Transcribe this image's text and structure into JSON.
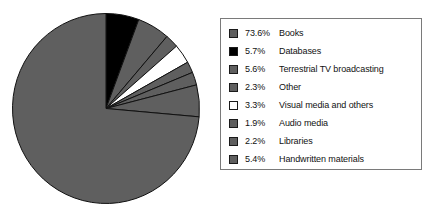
{
  "chart_data": {
    "type": "pie",
    "title": "",
    "subtitle": "",
    "xlabel": "",
    "ylabel": "",
    "legend_position": "right",
    "grid": false,
    "start_angle_deg": 0,
    "direction": "clockwise",
    "units": "percent",
    "categories": [
      "Books",
      "Databases",
      "Terrestrial TV broadcasting",
      "Other",
      "Visual media and others",
      "Audio media",
      "Libraries",
      "Handwritten materials"
    ],
    "values": [
      73.6,
      5.7,
      5.6,
      2.3,
      3.3,
      1.9,
      2.2,
      5.4
    ],
    "value_labels": [
      "73.6%",
      "5.7%",
      "5.6%",
      "2.3%",
      "3.3%",
      "1.9%",
      "2.2%",
      "5.4%"
    ],
    "colors": [
      "#5f5f5f",
      "#000000",
      "#5f5f5f",
      "#5f5f5f",
      "#ffffff",
      "#5f5f5f",
      "#5f5f5f",
      "#5f5f5f"
    ],
    "slice_order_clockwise_from_top": [
      "Databases",
      "Terrestrial TV broadcasting",
      "Other",
      "Visual media and others",
      "Audio media",
      "Libraries",
      "Handwritten materials",
      "Books"
    ],
    "total": 100.0
  },
  "legend": {
    "border_color": "#7a7a7a",
    "items": [
      {
        "pct": "73.6%",
        "label": "Books",
        "color": "#5f5f5f"
      },
      {
        "pct": "5.7%",
        "label": "Databases",
        "color": "#000000"
      },
      {
        "pct": "5.6%",
        "label": "Terrestrial TV broadcasting",
        "color": "#5f5f5f"
      },
      {
        "pct": "2.3%",
        "label": "Other",
        "color": "#5f5f5f"
      },
      {
        "pct": "3.3%",
        "label": "Visual media and others",
        "color": "#ffffff"
      },
      {
        "pct": "1.9%",
        "label": "Audio media",
        "color": "#5f5f5f"
      },
      {
        "pct": "2.2%",
        "label": "Libraries",
        "color": "#5f5f5f"
      },
      {
        "pct": "5.4%",
        "label": "Handwritten materials",
        "color": "#5f5f5f"
      }
    ]
  }
}
